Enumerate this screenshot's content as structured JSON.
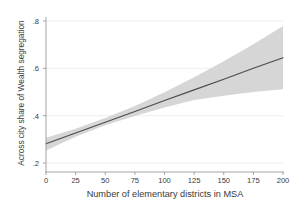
{
  "chart_data": {
    "type": "line",
    "title": "",
    "subtitle": "",
    "xlabel": "Number of elementary districts in MSA",
    "ylabel": "Across city share of Wealth segregation",
    "xlim": [
      0,
      200
    ],
    "ylim": [
      0.2,
      0.8
    ],
    "xticks": [
      0,
      25,
      50,
      75,
      100,
      125,
      150,
      175,
      200
    ],
    "xtick_labels": [
      "0",
      "25",
      "50",
      "75",
      "100",
      "125",
      "150",
      "175",
      "200"
    ],
    "yticks": [
      0.2,
      0.4,
      0.6,
      0.8
    ],
    "ytick_labels": [
      ".2",
      ".4",
      ".6",
      ".8"
    ],
    "grid": "horizontal-only",
    "grid_color": "#e8e8e8",
    "legend": null,
    "legend_position": "none",
    "series": [
      {
        "name": "Predicted across-city share of wealth segregation",
        "type": "line",
        "color": "#4a4a4a",
        "linewidth": 1.1,
        "x": [
          0,
          25,
          50,
          75,
          100,
          125,
          150,
          175,
          200
        ],
        "values": [
          0.281,
          0.327,
          0.372,
          0.418,
          0.464,
          0.509,
          0.554,
          0.6,
          0.645
        ]
      },
      {
        "name": "95% confidence interval",
        "type": "band",
        "color": "#d6d6d6",
        "x": [
          0,
          25,
          50,
          75,
          100,
          125,
          150,
          175,
          200
        ],
        "lower": [
          0.253,
          0.311,
          0.359,
          0.399,
          0.434,
          0.466,
          0.484,
          0.5,
          0.512
        ],
        "upper": [
          0.307,
          0.345,
          0.39,
          0.441,
          0.499,
          0.562,
          0.63,
          0.702,
          0.779
        ]
      }
    ],
    "annotations": []
  },
  "axes": {
    "y_axis_title": "Across city share of Wealth segregation",
    "x_axis_title": "Number of elementary districts in MSA",
    "axis_line_color": "#9a9a9a",
    "tick_label_color": "#3a3a3a",
    "background_color": "#ffffff"
  }
}
